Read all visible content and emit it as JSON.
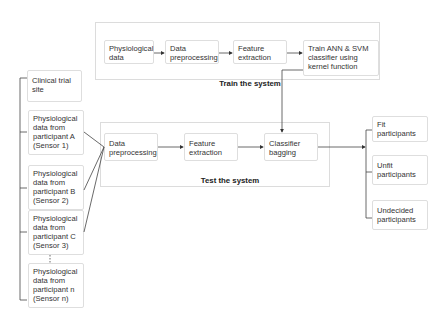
{
  "train": {
    "label": "Train the system",
    "nodes": [
      "Physiological data",
      "Data preprocessing",
      "Feature extraction",
      "Train ANN & SVM classifier using kernel function"
    ]
  },
  "test": {
    "label": "Test the system",
    "nodes": [
      "Data preprocessing",
      "Feature extraction",
      "Classifier bagging"
    ]
  },
  "inputs": {
    "site": "Clinical trial site",
    "participants": [
      "Physiological data from participant A (Sensor 1)",
      "Physiological data from participant B (Sensor 2)",
      "Physiological data from participant C (Sensor 3)",
      "Physiological data from participant n (Sensor n)"
    ]
  },
  "outputs": [
    "Fit participants",
    "Unfit participants",
    "Undecided participants"
  ]
}
